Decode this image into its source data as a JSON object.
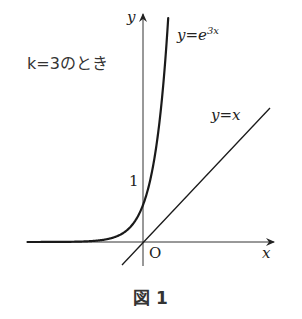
{
  "figure": {
    "caption": "図 1",
    "condition_label": "k=3のとき",
    "axes": {
      "x_label": "x",
      "y_label": "y",
      "origin_label": "O",
      "y_tick_label": "1"
    },
    "curves": [
      {
        "name": "exponential",
        "label_lhs": "y=e",
        "label_exp": "3x",
        "equation": "y=e^{3x}"
      },
      {
        "name": "identity",
        "label": "y=x",
        "equation": "y=x"
      }
    ],
    "colors": {
      "stroke": "#1a1a1a",
      "background": "#ffffff"
    }
  }
}
